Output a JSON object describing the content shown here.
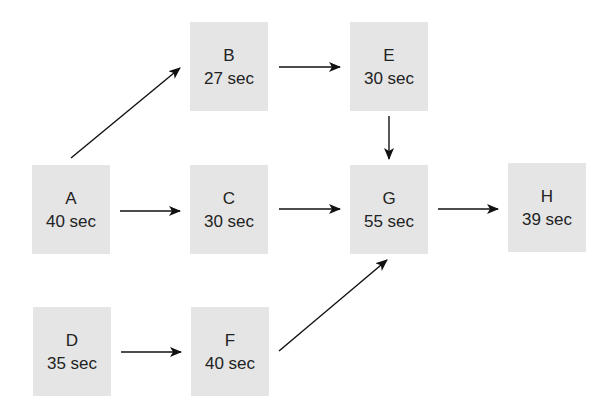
{
  "diagram": {
    "type": "precedence-network",
    "nodes": [
      {
        "id": "A",
        "label": "A",
        "time": "40 sec"
      },
      {
        "id": "B",
        "label": "B",
        "time": "27 sec"
      },
      {
        "id": "C",
        "label": "C",
        "time": "30 sec"
      },
      {
        "id": "D",
        "label": "D",
        "time": "35 sec"
      },
      {
        "id": "E",
        "label": "E",
        "time": "30 sec"
      },
      {
        "id": "F",
        "label": "F",
        "time": "40 sec"
      },
      {
        "id": "G",
        "label": "G",
        "time": "55 sec"
      },
      {
        "id": "H",
        "label": "H",
        "time": "39 sec"
      }
    ],
    "edges": [
      {
        "from": "A",
        "to": "B"
      },
      {
        "from": "A",
        "to": "C"
      },
      {
        "from": "B",
        "to": "E"
      },
      {
        "from": "C",
        "to": "G"
      },
      {
        "from": "E",
        "to": "G"
      },
      {
        "from": "D",
        "to": "F"
      },
      {
        "from": "F",
        "to": "G"
      },
      {
        "from": "G",
        "to": "H"
      }
    ],
    "colors": {
      "node_fill": "#e5e5e5",
      "text": "#222222",
      "edge": "#111111"
    }
  }
}
